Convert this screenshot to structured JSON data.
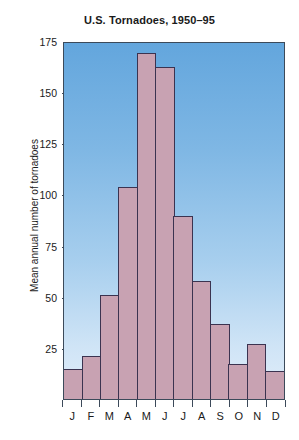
{
  "chart_data": {
    "type": "bar",
    "title": "U.S. Tornadoes, 1950–95",
    "xlabel": "",
    "ylabel": "Mean annual number of tornadoes",
    "categories": [
      "J",
      "F",
      "M",
      "A",
      "M",
      "J",
      "J",
      "A",
      "S",
      "O",
      "N",
      "D"
    ],
    "category_names": [
      "January",
      "February",
      "March",
      "April",
      "May",
      "June",
      "July",
      "August",
      "September",
      "October",
      "November",
      "December"
    ],
    "values": [
      15,
      21,
      51,
      104,
      170,
      163,
      90,
      58,
      37,
      17,
      27,
      14
    ],
    "ylim": [
      0,
      175
    ],
    "yticks": [
      175,
      150,
      125,
      100,
      75,
      50,
      25
    ],
    "ytick_labels": [
      "175",
      "150",
      "125",
      "100",
      "75",
      "50",
      "25"
    ],
    "grid": false,
    "legend": null,
    "colors": {
      "bar_fill": "#c8a2b2",
      "bar_edge": "#3b3350",
      "plot_bg_top": "#63a6dd",
      "plot_bg_bottom": "#e2eefa",
      "axis": "#3c4a5a",
      "text": "#1a1a1a",
      "figure_bg": "#ffffff"
    }
  }
}
